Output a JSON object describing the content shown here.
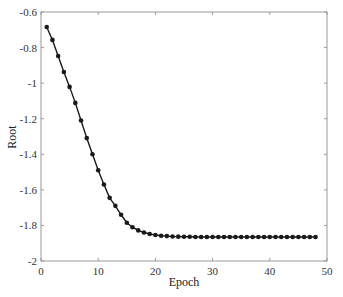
{
  "chart_data": {
    "type": "line",
    "title": "",
    "xlabel": "Epoch",
    "ylabel": "Root",
    "xlim": [
      0,
      50
    ],
    "ylim": [
      -2,
      -0.6
    ],
    "xticks": [
      0,
      10,
      20,
      30,
      40,
      50
    ],
    "yticks": [
      -0.6,
      -0.8,
      -1,
      -1.2,
      -1.4,
      -1.6,
      -1.8,
      -2
    ],
    "xtick_labels": [
      "0",
      "10",
      "20",
      "30",
      "40",
      "50"
    ],
    "ytick_labels": [
      "-0.6",
      "-0.8",
      "-1",
      "-1.2",
      "-1.4",
      "-1.6",
      "-1.8",
      "-2"
    ],
    "grid": false,
    "legend": null,
    "marker": "circle",
    "color": "#1a1a1a",
    "series": [
      {
        "name": "Root",
        "x": [
          1,
          2,
          3,
          4,
          5,
          6,
          7,
          8,
          9,
          10,
          11,
          12,
          13,
          14,
          15,
          16,
          17,
          18,
          19,
          20,
          21,
          22,
          23,
          24,
          25,
          26,
          27,
          28,
          29,
          30,
          31,
          32,
          33,
          34,
          35,
          36,
          37,
          38,
          39,
          40,
          41,
          42,
          43,
          44,
          45,
          46,
          47,
          48
        ],
        "values": [
          -0.684,
          -0.757,
          -0.847,
          -0.937,
          -1.021,
          -1.111,
          -1.21,
          -1.309,
          -1.4,
          -1.49,
          -1.57,
          -1.645,
          -1.69,
          -1.74,
          -1.785,
          -1.81,
          -1.828,
          -1.84,
          -1.848,
          -1.854,
          -1.858,
          -1.86,
          -1.862,
          -1.863,
          -1.864,
          -1.864,
          -1.865,
          -1.865,
          -1.865,
          -1.865,
          -1.865,
          -1.865,
          -1.865,
          -1.865,
          -1.865,
          -1.865,
          -1.865,
          -1.865,
          -1.865,
          -1.865,
          -1.865,
          -1.865,
          -1.865,
          -1.865,
          -1.865,
          -1.865,
          -1.865,
          -1.865
        ]
      }
    ]
  }
}
